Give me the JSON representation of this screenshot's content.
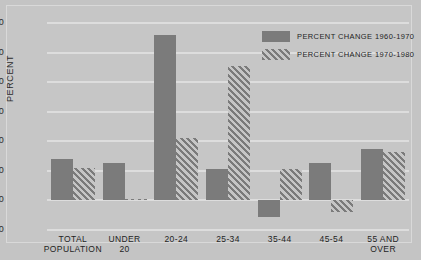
{
  "chart_data": {
    "type": "bar",
    "title": "",
    "xlabel": "",
    "ylabel": "PERCENT",
    "ylim": [
      -10,
      60
    ],
    "yticks": [
      -10,
      0,
      10,
      20,
      30,
      40,
      50,
      60
    ],
    "ytick_labels": [
      "-10",
      "0",
      "10",
      "20",
      "30",
      "40",
      "50",
      "60"
    ],
    "grid": true,
    "legend_position": "top-right",
    "categories": [
      "TOTAL\nPOPULATION",
      "UNDER\n20",
      "20-24",
      "25-34",
      "35-44",
      "45-54",
      "55 AND\nOVER"
    ],
    "series": [
      {
        "name": "PERCENT CHANGE 1960-1970",
        "style": "solid",
        "color": "#7b7b7b",
        "values": [
          14,
          12.5,
          56,
          10.5,
          -5.5,
          12.5,
          17.5
        ]
      },
      {
        "name": "PERCENT CHANGE 1970-1980",
        "style": "hatched",
        "color": "#7b7b7b",
        "values": [
          11,
          0.5,
          21,
          45.5,
          10.5,
          -4,
          16.5
        ]
      }
    ]
  },
  "legend": {
    "items": [
      {
        "label": "PERCENT CHANGE 1960-1970",
        "swatch": "solid-swatch"
      },
      {
        "label": "PERCENT CHANGE 1970-1980",
        "swatch": "hatched-swatch"
      }
    ]
  },
  "colors": {
    "background": "#c6c6c6",
    "bar": "#7b7b7b",
    "gridline": "#dddddd",
    "text": "#1f1f1f"
  }
}
